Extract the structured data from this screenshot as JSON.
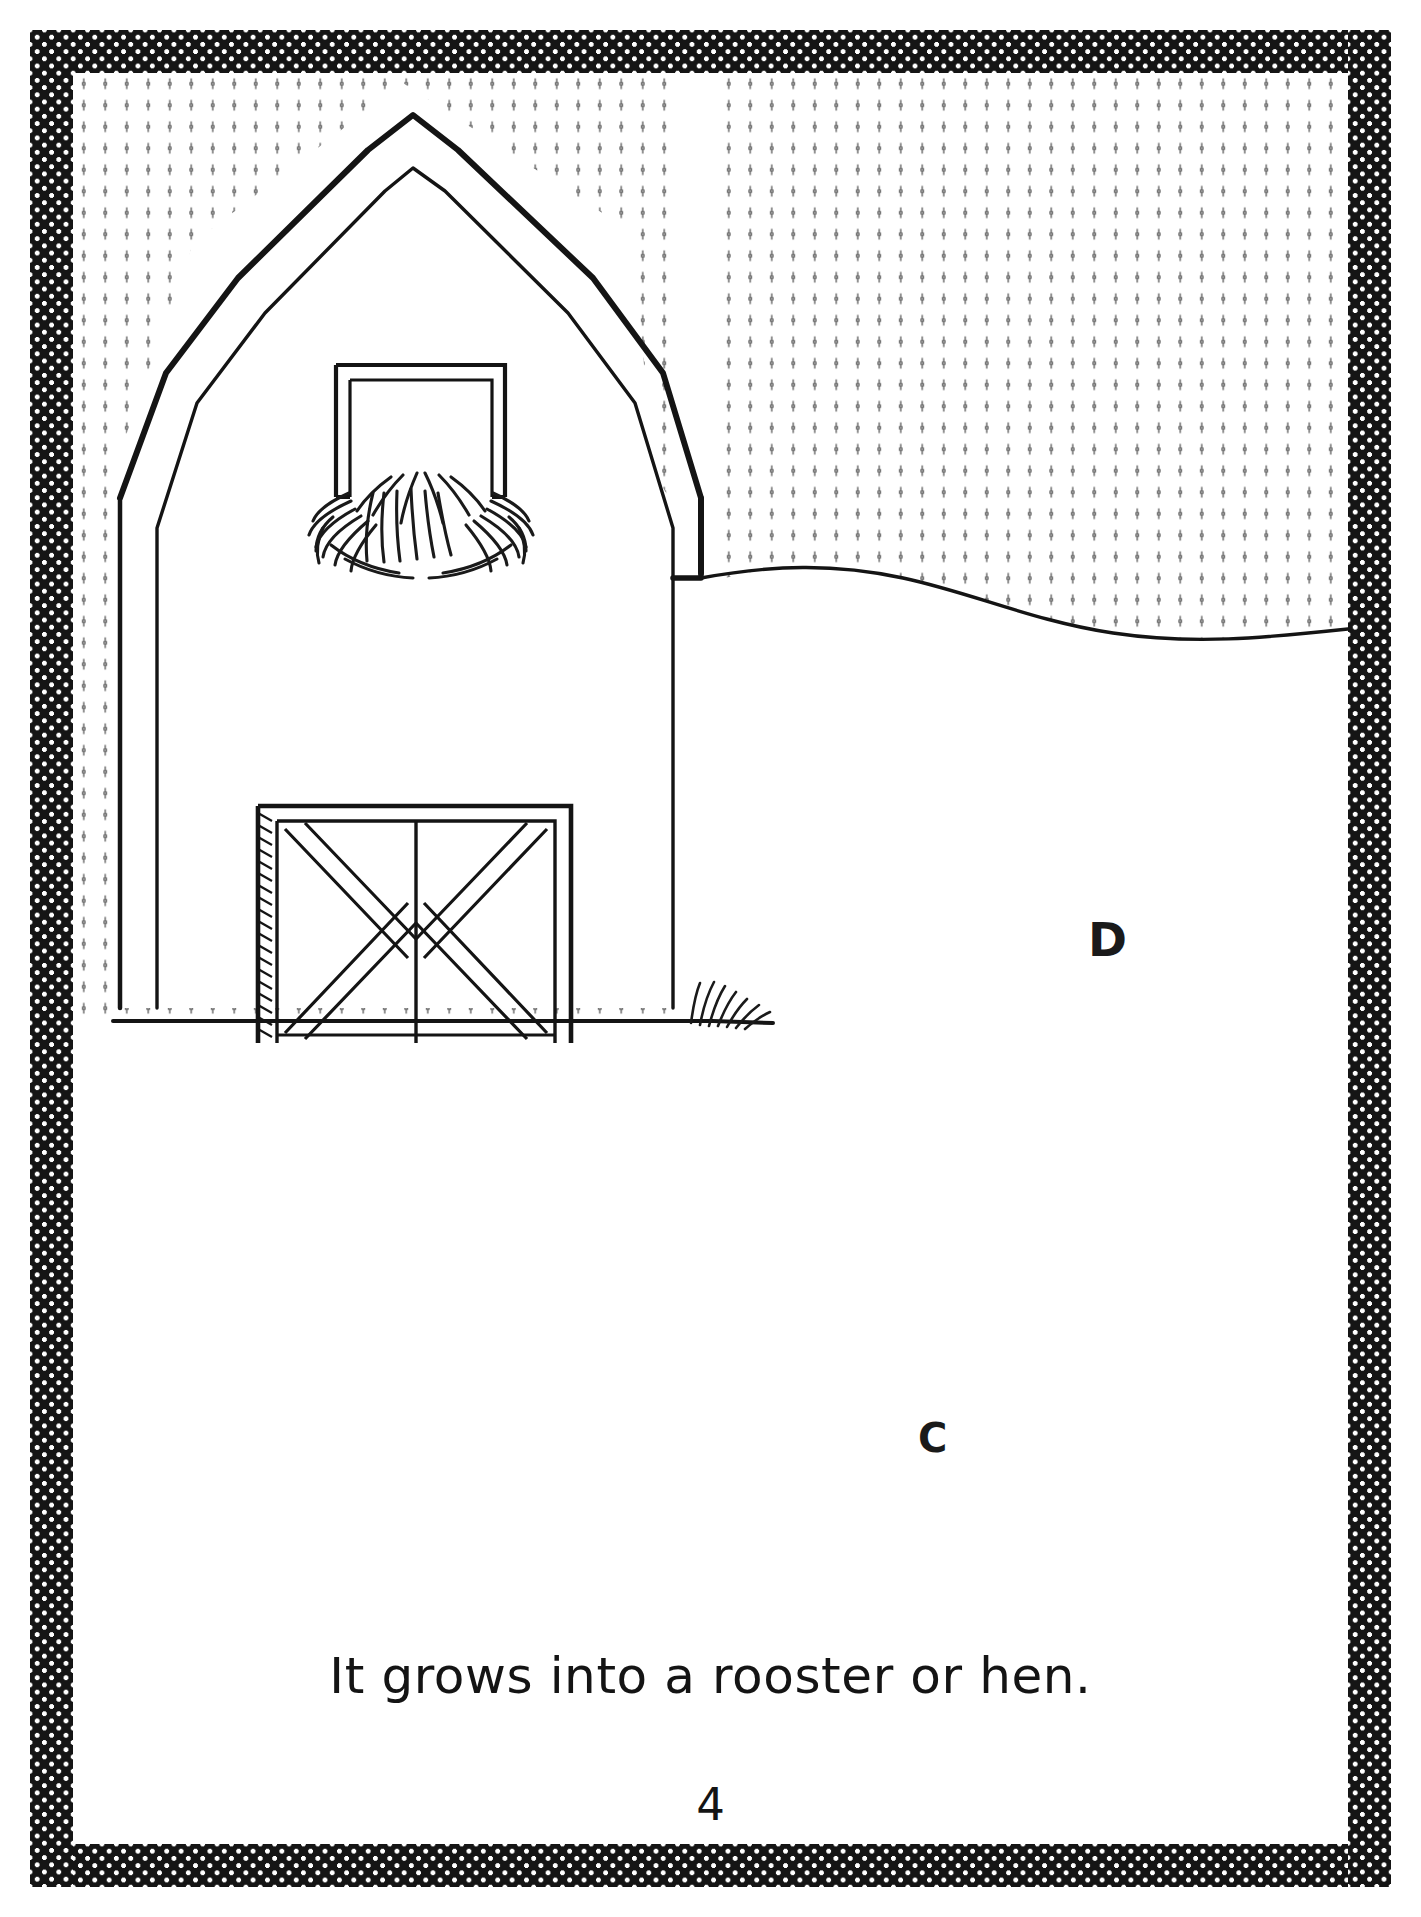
{
  "page": {
    "caption": "It grows into a rooster or hen.",
    "page_number": "4",
    "background_color": "#ffffff",
    "ink_color": "#141414"
  },
  "border": {
    "name": "checkered-decorative-border",
    "fill_color": "#151515",
    "dot_color": "#ffffff"
  },
  "markers": [
    {
      "id": "d",
      "label": "D"
    },
    {
      "id": "c",
      "label": "C"
    }
  ],
  "illustration": {
    "name": "barn-line-drawing",
    "subject": "barn",
    "parts": [
      {
        "name": "sky-dot-pattern",
        "label": "sky"
      },
      {
        "name": "gambrel-roof",
        "label": "roof"
      },
      {
        "name": "hay-loft-window",
        "label": "hay loft window"
      },
      {
        "name": "hay-burst",
        "label": "hay"
      },
      {
        "name": "barn-door",
        "label": "barn door"
      },
      {
        "name": "horizon-line",
        "label": "horizon"
      },
      {
        "name": "ground-line",
        "label": "ground"
      },
      {
        "name": "grass-tuft",
        "label": "grass"
      }
    ]
  }
}
